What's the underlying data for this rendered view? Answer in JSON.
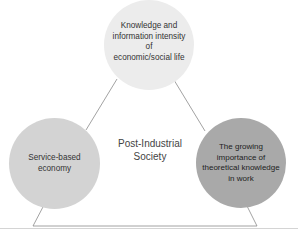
{
  "diagram": {
    "center_label": "Post-Industrial Society",
    "center_label_lines": [
      "Post-Industrial",
      "Society"
    ],
    "nodes": [
      {
        "id": "top",
        "label": "Knowledge and information intensity of economic/social life",
        "lines": [
          "Knowledge and",
          "information intensity of",
          "economic/social life"
        ],
        "fill": "#ececec"
      },
      {
        "id": "left",
        "label": "Service-based economy",
        "lines": [
          "Service-based",
          "economy"
        ],
        "fill": "#d3d3d3"
      },
      {
        "id": "right",
        "label": "The growing importance of theoretical knowledge in work",
        "lines": [
          "The growing",
          "importance of",
          "theoretical knowledge",
          "in work"
        ],
        "fill": "#a9a9a9"
      }
    ],
    "edges": [
      {
        "from": "top",
        "to": "left"
      },
      {
        "from": "top",
        "to": "right"
      },
      {
        "from": "left",
        "to": "right"
      }
    ],
    "line_color": "#8a8a8a",
    "rule_color": "#d4d4d4"
  }
}
